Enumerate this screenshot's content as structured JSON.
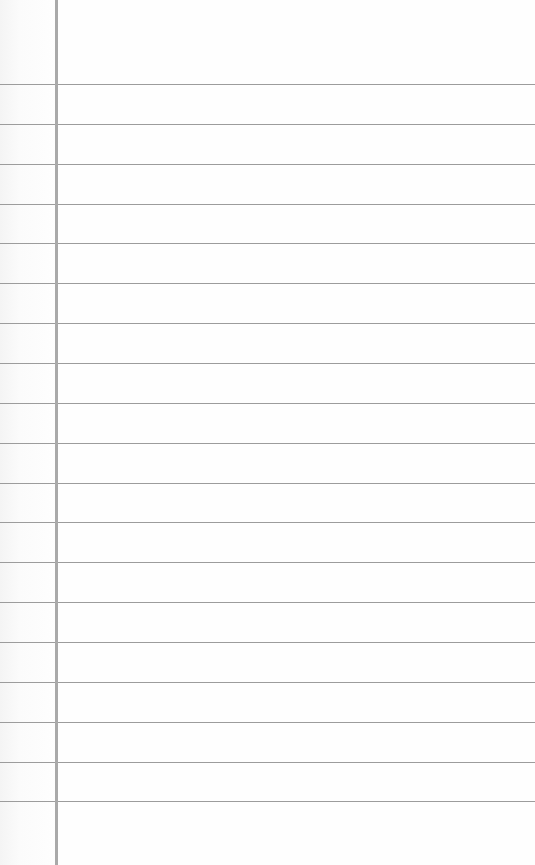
{
  "paper": {
    "type": "lined-notepaper",
    "background_color": "#fdfdfd",
    "rule_color": "#9c9c9c",
    "margin_line_color": "#a9a9a9",
    "margin_line_x": 55,
    "rule_positions_y": [
      84,
      124,
      164,
      204,
      243,
      283,
      323,
      363,
      403,
      443,
      483,
      522,
      562,
      602,
      642,
      682,
      722,
      762,
      801
    ]
  }
}
